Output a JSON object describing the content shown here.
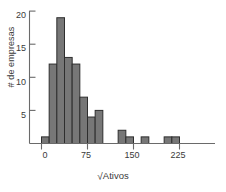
{
  "chart_data": {
    "type": "bar",
    "title": "",
    "subtitle": "",
    "xlabel": "√ Ativos",
    "ylabel": "# de empresas",
    "xlabel_parts": {
      "radical": "√",
      "text": "Ativos"
    },
    "x_tick_labels": [
      "0",
      "75",
      "150",
      "225"
    ],
    "x_tick_values": [
      0,
      75,
      150,
      225
    ],
    "y_tick_labels": [
      "5",
      "10",
      "15",
      "20"
    ],
    "y_tick_values": [
      5,
      10,
      15,
      20
    ],
    "xlim": [
      -12.5,
      262.5
    ],
    "ylim": [
      0,
      20.5
    ],
    "grid": false,
    "legend": null,
    "bin_width": 12.5,
    "bin_starts": [
      0,
      12.5,
      25,
      37.5,
      50,
      62.5,
      75,
      87.5,
      100,
      112.5,
      125,
      137.5,
      150,
      162.5,
      175,
      187.5,
      200,
      212.5,
      225,
      237.5
    ],
    "categories": [
      "0-12.5",
      "12.5-25",
      "25-37.5",
      "37.5-50",
      "50-62.5",
      "62.5-75",
      "75-87.5",
      "87.5-100",
      "100-112.5",
      "112.5-125",
      "125-137.5",
      "137.5-150",
      "150-162.5",
      "162.5-175",
      "175-187.5",
      "187.5-200",
      "200-212.5",
      "212.5-225",
      "225-237.5",
      "237.5-250"
    ],
    "values": [
      1,
      12,
      19,
      13,
      12,
      7,
      4,
      5,
      0,
      0,
      2,
      1,
      0,
      1,
      0,
      0,
      1,
      1,
      0,
      0
    ],
    "bar_color": "#777777",
    "bar_edge_color": "#2e2e2e",
    "axis_color": "#6a6a6a",
    "text_color": "#3a3a3a",
    "background_color": "#ffffff"
  }
}
